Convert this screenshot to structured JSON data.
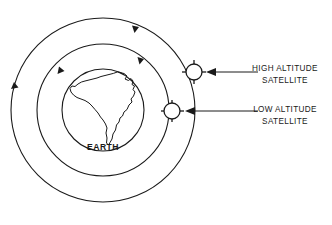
{
  "diagram": {
    "title_visible": false,
    "background_color": "#ffffff",
    "line_color": "#1a1a1a",
    "earth": {
      "label": "EARTH",
      "center_x": 103,
      "center_y": 110,
      "radius": 41,
      "continent_name": "south-america"
    },
    "orbits": [
      {
        "name": "low-altitude-orbit",
        "radius": 66,
        "center_x": 103,
        "center_y": 110,
        "direction": "clockwise",
        "arrow_count": 2
      },
      {
        "name": "high-altitude-orbit",
        "radius": 92,
        "center_x": 103,
        "center_y": 110,
        "direction": "clockwise",
        "arrow_count": 2
      }
    ],
    "satellites": [
      {
        "id": "high-altitude-satellite",
        "label_line1": "HIGH ALTITUDE",
        "label_line2": "SATELLITE",
        "x": 194,
        "y": 72,
        "body_radius": 8,
        "spoke_count": 4,
        "orbit": "high-altitude-orbit",
        "label_x": 285,
        "label_y1": 68,
        "label_y2": 80,
        "leader_from_x": 258,
        "leader_to_x": 207,
        "leader_y": 72
      },
      {
        "id": "low-altitude-satellite",
        "label_line1": "LOW ALTITUDE",
        "label_line2": "SATELLITE",
        "x": 172,
        "y": 111,
        "body_radius": 8,
        "spoke_count": 4,
        "orbit": "low-altitude-orbit",
        "label_x": 285,
        "label_y1": 110,
        "label_y2": 122,
        "leader_from_x": 258,
        "leader_to_x": 185,
        "leader_y": 111
      }
    ]
  }
}
